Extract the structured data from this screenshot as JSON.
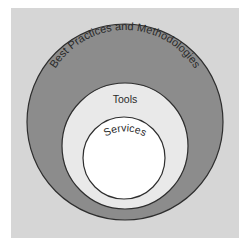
{
  "diagram": {
    "type": "nested-circles",
    "layers": [
      {
        "label": "Best Practices and Methodologies",
        "fill": "#8c8c8c"
      },
      {
        "label": "Tools",
        "fill": "#e9e9e9"
      },
      {
        "label": "Services",
        "fill": "#ffffff"
      }
    ],
    "background": "#d6d6d6",
    "stroke": "#2e2e2e",
    "text_color": "#2a2a2a"
  }
}
